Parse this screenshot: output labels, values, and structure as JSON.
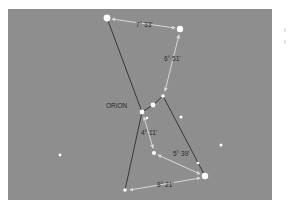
{
  "diagram": {
    "title": "ORION",
    "colors": {
      "background": "#8e8e8e",
      "star": "#ffffff",
      "figure_line": "#2c2c2c",
      "measure_line": "#d8d8d8",
      "label": "#2a2a2a"
    },
    "stars": [
      {
        "id": "top-left",
        "x": 107,
        "y": 18,
        "r": 3.4
      },
      {
        "id": "top-right",
        "x": 180,
        "y": 29,
        "r": 3.2
      },
      {
        "id": "belt-right",
        "x": 163,
        "y": 96,
        "r": 1.8
      },
      {
        "id": "belt-middle",
        "x": 153,
        "y": 105,
        "r": 2.4
      },
      {
        "id": "belt-left",
        "x": 142,
        "y": 112,
        "r": 2.4
      },
      {
        "id": "sword-top",
        "x": 147,
        "y": 118,
        "r": 1.3
      },
      {
        "id": "field-1",
        "x": 181,
        "y": 117,
        "r": 1.5
      },
      {
        "id": "sword-bottom",
        "x": 154,
        "y": 153,
        "r": 2.0
      },
      {
        "id": "knee-right",
        "x": 198,
        "y": 163,
        "r": 1.3
      },
      {
        "id": "bottom-right",
        "x": 205,
        "y": 176,
        "r": 3.2
      },
      {
        "id": "bottom-left",
        "x": 125,
        "y": 190,
        "r": 1.8
      },
      {
        "id": "field-2",
        "x": 221,
        "y": 145,
        "r": 1.5
      },
      {
        "id": "field-3",
        "x": 60,
        "y": 155,
        "r": 1.4
      }
    ],
    "figure_lines": [
      {
        "from": [
          107,
          18
        ],
        "to": [
          142,
          112
        ]
      },
      {
        "from": [
          142,
          112
        ],
        "to": [
          125,
          190
        ]
      },
      {
        "from": [
          142,
          112
        ],
        "to": [
          153,
          105
        ]
      },
      {
        "from": [
          153,
          105
        ],
        "to": [
          163,
          96
        ]
      },
      {
        "from": [
          163,
          96
        ],
        "to": [
          205,
          176
        ]
      }
    ],
    "measurements": [
      {
        "from": [
          112,
          19
        ],
        "to": [
          175,
          28
        ],
        "label": "7° 33'",
        "lx": 136,
        "ly": 25
      },
      {
        "from": [
          179,
          35
        ],
        "to": [
          165,
          91
        ],
        "label": "6° 51'",
        "lx": 164,
        "ly": 59
      },
      {
        "from": [
          144,
          117
        ],
        "to": [
          153,
          148
        ],
        "label": "4° 11'",
        "lx": 141,
        "ly": 133
      },
      {
        "from": [
          158,
          155
        ],
        "to": [
          200,
          174
        ],
        "label": "5° 39'",
        "lx": 173,
        "ly": 154
      },
      {
        "from": [
          200,
          178
        ],
        "to": [
          130,
          190
        ],
        "label": "8° 21'",
        "lx": 157,
        "ly": 185
      }
    ],
    "constellation_label": {
      "text": "ORION",
      "x": 106,
      "y": 106
    }
  }
}
